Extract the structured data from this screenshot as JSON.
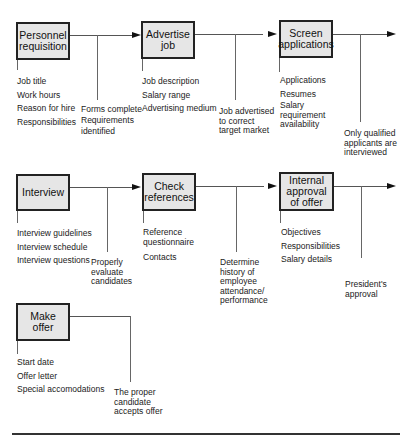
{
  "diagram": {
    "rows": [
      {
        "steps": [
          {
            "label": "Personnel requisition",
            "inputs": [
              "Job title",
              "Work hours",
              "Reason for hire",
              "Responsibilities"
            ]
          },
          {
            "label": "Advertise job",
            "inputs": [
              "Job description",
              "Salary range",
              "Advertising medium"
            ]
          },
          {
            "label": "Screen applications",
            "inputs": [
              "Applications",
              "Resumes",
              "Salary requirement availability"
            ]
          }
        ],
        "outcomes": [
          "Forms complete\nRequirements\nidentified",
          "Job advertised\nto correct\ntarget market",
          "Only qualified\napplicants are\ninterviewed"
        ]
      },
      {
        "steps": [
          {
            "label": "Interview",
            "inputs": [
              "Interview guidelines",
              "Interview schedule",
              "Interview questions"
            ]
          },
          {
            "label": "Check references",
            "inputs": [
              "Reference questionnaire",
              "Contacts"
            ]
          },
          {
            "label": "Internal approval of offer",
            "inputs": [
              "Objectives",
              "Responsibilities",
              "Salary details"
            ]
          }
        ],
        "outcomes": [
          "Properly\nevaluate\ncandidates",
          "Determine\nhistory of\nemployee\nattendance/\nperformance",
          "President's\napproval"
        ]
      },
      {
        "steps": [
          {
            "label": "Make offer",
            "inputs": [
              "Start date",
              "Offer letter",
              "Special accomodations"
            ]
          }
        ],
        "outcomes": [
          "The proper\ncandidate\naccepts offer"
        ]
      }
    ]
  }
}
